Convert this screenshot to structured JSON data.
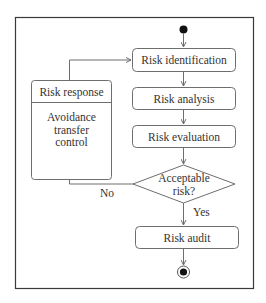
{
  "diagram": {
    "type": "UML activity diagram",
    "title": "",
    "colors": {
      "frame": "#3a3a3a",
      "node_border": "#6e6e6e",
      "edge": "#6e6e6e",
      "text": "#333333",
      "fill": "#ffffff",
      "start_fill": "#111111"
    },
    "nodes": {
      "start": {
        "kind": "initial-node"
      },
      "identification": {
        "kind": "activity",
        "label": "Risk identification"
      },
      "analysis": {
        "kind": "activity",
        "label": "Risk analysis"
      },
      "evaluation": {
        "kind": "activity",
        "label": "Risk evaluation"
      },
      "decision": {
        "kind": "decision",
        "label_line1": "Acceptable",
        "label_line2": "risk?"
      },
      "audit": {
        "kind": "activity",
        "label": "Risk audit"
      },
      "end": {
        "kind": "final-node"
      },
      "response": {
        "kind": "activity-with-compartment",
        "label": "Risk response",
        "body_line1": "Avoidance",
        "body_line2": "transfer",
        "body_line3": "control"
      }
    },
    "edges": {
      "no_label": "No",
      "yes_label": "Yes",
      "list": [
        {
          "from": "start",
          "to": "identification"
        },
        {
          "from": "identification",
          "to": "analysis"
        },
        {
          "from": "analysis",
          "to": "evaluation"
        },
        {
          "from": "evaluation",
          "to": "decision"
        },
        {
          "from": "decision",
          "to": "audit",
          "label": "Yes"
        },
        {
          "from": "decision",
          "to": "response",
          "label": "No"
        },
        {
          "from": "response",
          "to": "identification"
        },
        {
          "from": "audit",
          "to": "end"
        }
      ]
    }
  }
}
